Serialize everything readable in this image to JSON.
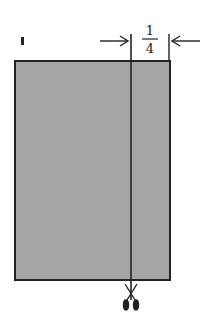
{
  "diagram": {
    "label_marker": "I",
    "measurement": {
      "numerator": "1",
      "denominator": "4",
      "meaning": "cut 1/4 from right edge"
    },
    "colors": {
      "panel_fill": "#a6a6a6",
      "stroke": "#222222",
      "background": "#ffffff"
    },
    "icons": {
      "cut_tool": "scissors-icon",
      "left_arrow": "arrow-right-icon",
      "right_arrow": "arrow-left-icon"
    }
  }
}
